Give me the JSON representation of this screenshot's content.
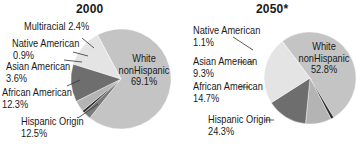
{
  "chart_data": [
    {
      "type": "pie",
      "title": "2000",
      "categories": [
        "White nonHispanic",
        "Multiracial",
        "Native American",
        "Asian American",
        "African American",
        "Hispanic Origin"
      ],
      "values": [
        69.1,
        2.4,
        0.9,
        3.6,
        12.3,
        12.5
      ],
      "labels": {
        "white_line1": "White",
        "white_line2": "nonHispanic",
        "white_val": "69.1%",
        "multiracial": "Multiracial 2.4%",
        "native": "Native American",
        "native_val": "0.9%",
        "asian": "Asian American",
        "asian_val": "3.6%",
        "african": "African American",
        "african_val": "12.3%",
        "hispanic": "Hispanic Origin",
        "hispanic_val": "12.5%"
      }
    },
    {
      "type": "pie",
      "title": "2050*",
      "categories": [
        "White nonHispanic",
        "Native American",
        "Asian American",
        "African American",
        "Hispanic Origin"
      ],
      "values": [
        52.8,
        1.1,
        9.3,
        14.7,
        24.3
      ],
      "labels": {
        "white_line1": "White",
        "white_line2": "nonHispanic",
        "white_val": "52.8%",
        "native": "Native American",
        "native_val": "1.1%",
        "asian": "Asian American",
        "asian_val": "9.3%",
        "african": "African American",
        "african_val": "14.7%",
        "hispanic": "Hispanic Origin",
        "hispanic_val": "24.3%"
      }
    }
  ],
  "colors": {
    "white": "#c4c4c4",
    "multiracial": "#7a7a7a",
    "native": "#2e2e2e",
    "asian": "#b4b4b4",
    "african": "#6e6e6e",
    "hispanic": "#e4e4e4",
    "leader": "#333333"
  }
}
